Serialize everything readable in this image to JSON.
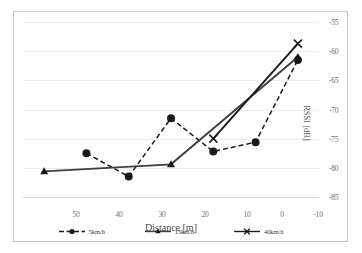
{
  "chart_data": {
    "type": "line",
    "title": "",
    "xlabel": "Distance [m]",
    "ylabel": "RSSI [dB]",
    "x": [
      50,
      40,
      30,
      20,
      10,
      0,
      -10
    ],
    "xtick_labels": [
      "50",
      "40",
      "30",
      "20",
      "10",
      "0",
      "-10"
    ],
    "xlim": [
      55,
      -15
    ],
    "x_axis_reversed": true,
    "ytick_labels": [
      "-55",
      "-60",
      "-65",
      "-70",
      "-75",
      "-80",
      "-85"
    ],
    "ytick_values": [
      -55,
      -60,
      -65,
      -70,
      -75,
      -80,
      -85
    ],
    "ylim": [
      -85,
      -55
    ],
    "grid": true,
    "legend_position": "bottom",
    "series": [
      {
        "name": "5km/h",
        "marker": "circle",
        "linestyle": "dashed",
        "color": "#1a1a1a",
        "x": [
          40,
          30,
          20,
          10,
          0,
          -10
        ],
        "values": [
          -77.5,
          -81.5,
          -71.5,
          -77.2,
          -75.6,
          -61.5
        ]
      },
      {
        "name": "15km/h",
        "marker": "triangle",
        "linestyle": "solid",
        "color": "#3f3f3f",
        "x": [
          50,
          20,
          -10
        ],
        "values": [
          -80.6,
          -79.4,
          -61.0
        ]
      },
      {
        "name": "40km/h",
        "marker": "cross",
        "linestyle": "solid",
        "color": "#1a1a1a",
        "x": [
          10,
          -10
        ],
        "values": [
          -75.0,
          -58.7
        ]
      }
    ]
  },
  "axes": {
    "ylabel_text": "RSSI [dB]",
    "xlabel_text": "Distance [m]"
  },
  "legend": {
    "items": [
      {
        "label": "5km/h"
      },
      {
        "label": "15km/h"
      },
      {
        "label": "40km/h"
      }
    ]
  },
  "style": {
    "grid_color": "#ececec",
    "border_color": "#c9c9c9",
    "tick_color": "#6e6e6e",
    "background": "#ffffff"
  }
}
